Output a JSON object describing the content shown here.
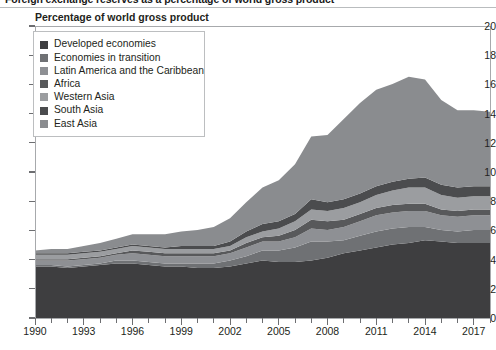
{
  "figure": {
    "headline": "Foreign exchange reserves as a percentage of world gross product",
    "subtitle": "Percentage of world gross product"
  },
  "legend": {
    "items": [
      {
        "label": "Developed economies",
        "color": "#3e3e40"
      },
      {
        "label": "Economies in transition",
        "color": "#6f7174"
      },
      {
        "label": "Latin America and the Caribbean",
        "color": "#8e9094"
      },
      {
        "label": "Africa",
        "color": "#58595b"
      },
      {
        "label": "Western Asia",
        "color": "#9b9da0"
      },
      {
        "label": "South Asia",
        "color": "#4b4c4e"
      },
      {
        "label": "East Asia",
        "color": "#8a8c8f"
      }
    ]
  },
  "axes": {
    "y": {
      "label": "",
      "min": 0,
      "max": 20,
      "step": 2,
      "ticks": [
        "0",
        "2",
        "4",
        "6",
        "8",
        "10",
        "12",
        "14",
        "16",
        "18",
        "20"
      ]
    },
    "x": {
      "label": "",
      "min": 1990,
      "max": 2018,
      "tick_labels": [
        "1990",
        "1993",
        "1996",
        "1999",
        "2002",
        "2005",
        "2008",
        "2011",
        "2014",
        "2017"
      ]
    }
  },
  "chart_data": {
    "type": "area",
    "stacked": true,
    "title": "Foreign exchange reserves as a percentage of world gross product",
    "subtitle": "Percentage of world gross product",
    "xlabel": "",
    "ylabel": "Percentage of world gross product",
    "xlim": [
      1990,
      2018
    ],
    "ylim": [
      0,
      20
    ],
    "grid": false,
    "legend_position": "inside-top-left",
    "x": [
      1990,
      1991,
      1992,
      1993,
      1994,
      1995,
      1996,
      1997,
      1998,
      1999,
      2000,
      2001,
      2002,
      2003,
      2004,
      2005,
      2006,
      2007,
      2008,
      2009,
      2010,
      2011,
      2012,
      2013,
      2014,
      2015,
      2016,
      2017,
      2018
    ],
    "categories": [
      1990,
      1991,
      1992,
      1993,
      1994,
      1995,
      1996,
      1997,
      1998,
      1999,
      2000,
      2001,
      2002,
      2003,
      2004,
      2005,
      2006,
      2007,
      2008,
      2009,
      2010,
      2011,
      2012,
      2013,
      2014,
      2015,
      2016,
      2017,
      2018
    ],
    "series": [
      {
        "name": "Developed economies",
        "color": "#3e3e40",
        "values": [
          3.6,
          3.6,
          3.5,
          3.6,
          3.7,
          3.8,
          3.8,
          3.7,
          3.6,
          3.6,
          3.5,
          3.5,
          3.6,
          3.8,
          4.0,
          3.9,
          3.9,
          4.0,
          4.2,
          4.5,
          4.7,
          4.9,
          5.1,
          5.2,
          5.4,
          5.3,
          5.2,
          5.2,
          5.2
        ]
      },
      {
        "name": "Economies in transition",
        "color": "#6f7174",
        "values": [
          0.1,
          0.1,
          0.1,
          0.1,
          0.1,
          0.2,
          0.2,
          0.2,
          0.2,
          0.2,
          0.3,
          0.3,
          0.4,
          0.5,
          0.7,
          0.8,
          1.0,
          1.3,
          1.1,
          0.9,
          1.0,
          1.1,
          1.1,
          1.1,
          0.9,
          0.8,
          0.8,
          0.9,
          0.9
        ]
      },
      {
        "name": "Latin America and the Caribbean",
        "color": "#8e9094",
        "values": [
          0.3,
          0.3,
          0.4,
          0.4,
          0.4,
          0.4,
          0.5,
          0.5,
          0.5,
          0.5,
          0.5,
          0.5,
          0.5,
          0.6,
          0.6,
          0.6,
          0.7,
          0.9,
          0.8,
          0.9,
          1.0,
          1.1,
          1.1,
          1.1,
          1.1,
          1.0,
          1.0,
          1.0,
          1.0
        ]
      },
      {
        "name": "Africa",
        "color": "#58595b",
        "values": [
          0.1,
          0.1,
          0.1,
          0.1,
          0.1,
          0.1,
          0.2,
          0.2,
          0.2,
          0.2,
          0.2,
          0.2,
          0.2,
          0.3,
          0.3,
          0.4,
          0.5,
          0.6,
          0.6,
          0.5,
          0.5,
          0.5,
          0.5,
          0.5,
          0.5,
          0.4,
          0.4,
          0.4,
          0.4
        ]
      },
      {
        "name": "Western Asia",
        "color": "#9b9da0",
        "values": [
          0.3,
          0.3,
          0.3,
          0.3,
          0.3,
          0.3,
          0.3,
          0.3,
          0.3,
          0.3,
          0.3,
          0.3,
          0.3,
          0.4,
          0.4,
          0.5,
          0.6,
          0.7,
          0.7,
          0.8,
          0.8,
          0.9,
          1.0,
          1.1,
          1.1,
          1.0,
          0.9,
          0.9,
          0.9
        ]
      },
      {
        "name": "South Asia",
        "color": "#4b4c4e",
        "values": [
          0.1,
          0.1,
          0.1,
          0.1,
          0.1,
          0.1,
          0.1,
          0.1,
          0.1,
          0.2,
          0.2,
          0.2,
          0.3,
          0.4,
          0.5,
          0.5,
          0.5,
          0.7,
          0.6,
          0.6,
          0.6,
          0.6,
          0.6,
          0.6,
          0.7,
          0.7,
          0.7,
          0.7,
          0.7
        ]
      },
      {
        "name": "East Asia",
        "color": "#8a8c8f",
        "values": [
          0.2,
          0.3,
          0.3,
          0.4,
          0.5,
          0.6,
          0.7,
          0.8,
          0.9,
          1.0,
          1.1,
          1.3,
          1.6,
          2.0,
          2.5,
          2.8,
          3.4,
          4.3,
          4.6,
          5.5,
          6.2,
          6.6,
          6.7,
          7.0,
          6.7,
          5.8,
          5.3,
          5.2,
          5.1
        ]
      }
    ],
    "totals": [
      4.7,
      4.8,
      4.8,
      5.0,
      5.2,
      5.5,
      5.8,
      5.8,
      5.8,
      6.0,
      6.1,
      6.3,
      6.9,
      8.0,
      9.0,
      9.5,
      10.6,
      12.5,
      12.6,
      13.7,
      14.8,
      15.7,
      16.1,
      16.6,
      16.4,
      15.0,
      14.3,
      14.3,
      14.2
    ]
  }
}
